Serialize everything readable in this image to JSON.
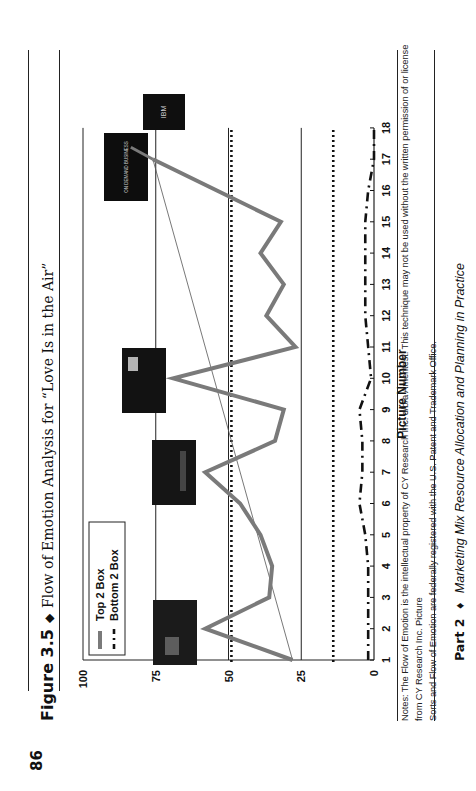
{
  "page": {
    "page_number": "86",
    "figure_label": "Figure 3.5",
    "diamond": "◆",
    "figure_title": "Flow of Emotion Analysis for “Love Is in the Air”",
    "notes_line1": "Notes: The Flow of Emotion is the intellectual property of CY Research Inc. d/b/a Ameritest. This technique may not be used without the written permission of or license from CY Research Inc. Picture",
    "notes_line2": "Sorts and Flow of Emotion are federally registered with the U.S. Patent and Trademark Office.",
    "footer_part": "Part 2",
    "footer_diamond": "♦",
    "footer_subtitle": "Marketing Mix Resource Allocation and Planning in Practice"
  },
  "thumbnails": [
    {
      "label": "thumbnail-picture-1",
      "caption": ""
    },
    {
      "label": "thumbnail-picture-7",
      "caption": ""
    },
    {
      "label": "thumbnail-picture-10",
      "caption": ""
    },
    {
      "label": "thumbnail-on-demand-business",
      "caption": "ON DEMAND BUSINESS"
    },
    {
      "label": "thumbnail-ibm-logo",
      "caption": "IBM"
    }
  ],
  "colors": {
    "top2": "#7a7a7a",
    "bottom2": "#111111",
    "trend": "#555555",
    "grid": "#222222"
  },
  "chart_data": {
    "type": "line",
    "title": "Flow of Emotion Analysis for “Love Is in the Air”",
    "xlabel": "Picture Number",
    "ylabel": "",
    "x": [
      1,
      2,
      3,
      4,
      5,
      6,
      7,
      8,
      9,
      10,
      11,
      12,
      13,
      14,
      15,
      16,
      17,
      18
    ],
    "xticks": [
      "1",
      "2",
      "3",
      "4",
      "5",
      "6",
      "7",
      "8",
      "9",
      "10",
      "11",
      "12",
      "13",
      "14",
      "15",
      "16",
      "17",
      "18"
    ],
    "yticks": [
      "0",
      "25",
      "50",
      "75",
      "100"
    ],
    "ylim": [
      0,
      100
    ],
    "grid": "solid lines at 25, 50, 75; dotted reference lines at ~49 and ~14",
    "legend_position": "upper-left",
    "series": [
      {
        "name": "Top 2 Box",
        "style": "thick gray solid",
        "values": [
          28,
          58,
          36,
          35,
          39,
          46,
          58,
          34,
          31,
          69,
          27,
          37,
          31,
          39,
          32,
          54,
          76,
          null
        ]
      },
      {
        "name": "Bottom 2 Box",
        "style": "black dash-dot",
        "values": [
          2,
          2,
          2,
          2,
          3,
          5,
          4,
          4,
          5,
          1,
          2,
          3,
          3,
          3,
          3,
          2,
          0,
          0
        ]
      }
    ],
    "reference_lines": [
      {
        "value": 49,
        "style": "dotted"
      },
      {
        "value": 14,
        "style": "dotted"
      }
    ],
    "trend_line": {
      "from": [
        1,
        28
      ],
      "to": [
        17,
        76
      ],
      "style": "thin gray"
    }
  }
}
